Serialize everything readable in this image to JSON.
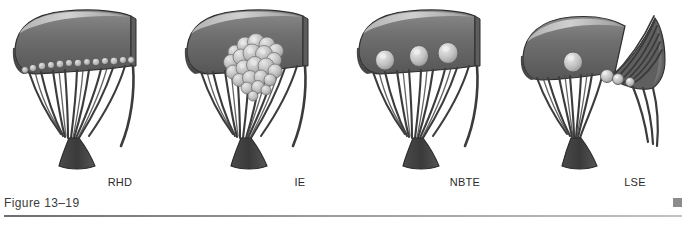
{
  "figure": {
    "caption": "Figure 13–19",
    "corner_mark": "page-corner-square",
    "background": "#ffffff",
    "rule_color": "#6e6e6e"
  },
  "palette": {
    "leaflet_dark": "#4a4a4a",
    "leaflet_mid": "#6d6d6d",
    "leaflet_light": "#8f8f8f",
    "highlight": "#cfcfcf",
    "chordae": "#3c3c3c",
    "papillary": "#4f4f4f",
    "vegetation_light": "#c9c9c9",
    "vegetation_shadow": "#8a8a8a",
    "outline": "#2e2e2e"
  },
  "panels": [
    {
      "id": "rhd",
      "label": "RHD",
      "condition": "Rheumatic Heart Disease",
      "vegetation_pattern": "small uniform verrucae in a single row along the line of closure",
      "vegetation_count": 14,
      "vegetation_size": "small",
      "leaflet_state": "intact",
      "chordae_state": "thickened, fused"
    },
    {
      "id": "ie",
      "label": "IE",
      "condition": "Infective Endocarditis",
      "vegetation_pattern": "single large bulky irregular destructive mass",
      "vegetation_count": 1,
      "vegetation_size": "large",
      "leaflet_state": "eroded",
      "chordae_state": "intact"
    },
    {
      "id": "nbte",
      "label": "NBTE",
      "condition": "Nonbacterial Thrombotic Endocarditis",
      "vegetation_pattern": "few small to medium bland vegetations along the closure line",
      "vegetation_count": 3,
      "vegetation_size": "medium",
      "leaflet_state": "intact",
      "chordae_state": "intact"
    },
    {
      "id": "lse",
      "label": "LSE",
      "condition": "Libman-Sacks Endocarditis",
      "vegetation_pattern": "small to medium vegetations on both surfaces of the leaflet",
      "vegetation_count": 4,
      "vegetation_size": "small-medium",
      "leaflet_state": "intact",
      "chordae_state": "intact"
    }
  ]
}
